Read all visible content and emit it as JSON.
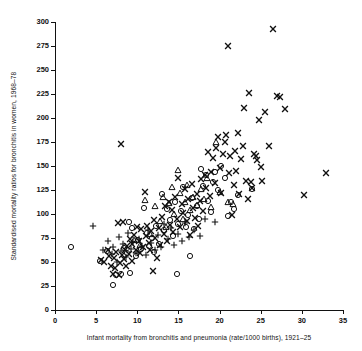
{
  "chart_data": {
    "type": "scatter",
    "title": "",
    "xlabel": "Infant mortality from bronchitis and pneumonia (rate/1000 births), 1921–25",
    "ylabel": "Standardised mortality ratios for bronchitis in women, 1968–78",
    "xlim": [
      0,
      35
    ],
    "ylim": [
      0,
      300
    ],
    "xticks": [
      0,
      5,
      10,
      15,
      20,
      25,
      30,
      35
    ],
    "yticks": [
      0,
      25,
      50,
      75,
      100,
      125,
      150,
      175,
      200,
      225,
      250,
      275,
      300
    ],
    "grid": false,
    "legend": "none",
    "marker_color": "#111111",
    "background": "#ffffff",
    "marker_types": [
      "cross",
      "circle",
      "triangle",
      "plus"
    ],
    "series": [
      {
        "name": "cross",
        "marker": "cross",
        "points": [
          [
            5.6,
            52
          ],
          [
            6.0,
            50
          ],
          [
            6.4,
            62
          ],
          [
            6.6,
            56
          ],
          [
            6.8,
            46
          ],
          [
            7.0,
            38
          ],
          [
            7.2,
            54
          ],
          [
            7.3,
            44
          ],
          [
            7.4,
            60
          ],
          [
            7.6,
            91
          ],
          [
            7.8,
            36
          ],
          [
            7.9,
            49
          ],
          [
            8.0,
            173
          ],
          [
            8.1,
            57
          ],
          [
            8.3,
            92
          ],
          [
            8.4,
            53
          ],
          [
            8.5,
            62
          ],
          [
            8.6,
            46
          ],
          [
            8.8,
            67
          ],
          [
            9.0,
            58
          ],
          [
            9.1,
            74
          ],
          [
            9.3,
            51
          ],
          [
            9.4,
            69
          ],
          [
            9.6,
            78
          ],
          [
            9.8,
            63
          ],
          [
            10.0,
            86
          ],
          [
            10.2,
            72
          ],
          [
            10.3,
            59
          ],
          [
            10.5,
            84
          ],
          [
            10.7,
            66
          ],
          [
            10.9,
            123
          ],
          [
            11.0,
            77
          ],
          [
            11.2,
            88
          ],
          [
            11.4,
            70
          ],
          [
            11.5,
            62
          ],
          [
            11.7,
            82
          ],
          [
            11.9,
            41
          ],
          [
            12.0,
            94
          ],
          [
            12.2,
            75
          ],
          [
            12.4,
            54
          ],
          [
            12.6,
            85
          ],
          [
            12.8,
            68
          ],
          [
            13.0,
            97
          ],
          [
            13.2,
            79
          ],
          [
            13.4,
            108
          ],
          [
            13.6,
            72
          ],
          [
            13.8,
            113
          ],
          [
            14.0,
            89
          ],
          [
            14.2,
            104
          ],
          [
            14.4,
            81
          ],
          [
            14.6,
            118
          ],
          [
            14.8,
            95
          ],
          [
            15.0,
            137
          ],
          [
            15.2,
            86
          ],
          [
            15.4,
            110
          ],
          [
            15.6,
            101
          ],
          [
            15.8,
            126
          ],
          [
            16.0,
            93
          ],
          [
            16.2,
            116
          ],
          [
            16.4,
            78
          ],
          [
            16.6,
            131
          ],
          [
            16.8,
            106
          ],
          [
            17.0,
            96
          ],
          [
            17.2,
            121
          ],
          [
            17.4,
            88
          ],
          [
            17.6,
            114
          ],
          [
            17.8,
            136
          ],
          [
            18.0,
            103
          ],
          [
            18.2,
            141
          ],
          [
            18.4,
            127
          ],
          [
            18.6,
            165
          ],
          [
            18.8,
            119
          ],
          [
            19.0,
            144
          ],
          [
            19.2,
            158
          ],
          [
            19.4,
            132
          ],
          [
            19.6,
            169
          ],
          [
            19.8,
            180
          ],
          [
            20.0,
            148
          ],
          [
            20.2,
            122
          ],
          [
            20.4,
            163
          ],
          [
            20.6,
            175
          ],
          [
            20.8,
            182
          ],
          [
            21.0,
            275
          ],
          [
            21.1,
            143
          ],
          [
            21.3,
            160
          ],
          [
            21.5,
            99
          ],
          [
            21.7,
            130
          ],
          [
            21.9,
            166
          ],
          [
            22.0,
            145
          ],
          [
            22.2,
            184
          ],
          [
            22.4,
            121
          ],
          [
            22.6,
            157
          ],
          [
            22.8,
            171
          ],
          [
            23.0,
            210
          ],
          [
            23.2,
            134
          ],
          [
            23.4,
            116
          ],
          [
            23.6,
            226
          ],
          [
            23.8,
            133
          ],
          [
            24.0,
            127
          ],
          [
            24.2,
            163
          ],
          [
            24.4,
            160
          ],
          [
            24.6,
            156
          ],
          [
            24.8,
            198
          ],
          [
            25.0,
            149
          ],
          [
            25.2,
            134
          ],
          [
            25.5,
            206
          ],
          [
            26.0,
            171
          ],
          [
            26.5,
            293
          ],
          [
            27.0,
            223
          ],
          [
            27.4,
            222
          ],
          [
            28.0,
            209
          ],
          [
            30.2,
            120
          ],
          [
            32.9,
            143
          ]
        ]
      },
      {
        "name": "circle",
        "marker": "circle",
        "points": [
          [
            2.0,
            66
          ],
          [
            5.5,
            51
          ],
          [
            6.3,
            61
          ],
          [
            7.0,
            26
          ],
          [
            7.4,
            36
          ],
          [
            8.0,
            37
          ],
          [
            8.4,
            65
          ],
          [
            8.8,
            59
          ],
          [
            9.0,
            92
          ],
          [
            9.1,
            39
          ],
          [
            9.4,
            85
          ],
          [
            9.8,
            56
          ],
          [
            10.1,
            73
          ],
          [
            10.4,
            64
          ],
          [
            10.8,
            106
          ],
          [
            11.2,
            80
          ],
          [
            11.4,
            67
          ],
          [
            11.8,
            75
          ],
          [
            12.0,
            60
          ],
          [
            12.3,
            88
          ],
          [
            12.6,
            69
          ],
          [
            13.0,
            121
          ],
          [
            13.3,
            83
          ],
          [
            13.6,
            105
          ],
          [
            14.0,
            94
          ],
          [
            14.3,
            77
          ],
          [
            14.6,
            112
          ],
          [
            14.8,
            37
          ],
          [
            15.0,
            90
          ],
          [
            15.3,
            103
          ],
          [
            15.6,
            128
          ],
          [
            15.9,
            86
          ],
          [
            16.2,
            99
          ],
          [
            16.4,
            56
          ],
          [
            16.6,
            117
          ],
          [
            16.9,
            84
          ],
          [
            17.2,
            108
          ],
          [
            17.5,
            95
          ],
          [
            17.8,
            147
          ],
          [
            18.0,
            129
          ],
          [
            18.3,
            141
          ],
          [
            18.6,
            114
          ],
          [
            18.9,
            102
          ],
          [
            19.2,
            133
          ],
          [
            19.5,
            144
          ],
          [
            19.8,
            125
          ],
          [
            20.2,
            150
          ],
          [
            20.6,
            137
          ],
          [
            21.0,
            98
          ],
          [
            21.4,
            112
          ],
          [
            21.8,
            105
          ],
          [
            22.2,
            120
          ],
          [
            24.0,
            126
          ]
        ]
      },
      {
        "name": "triangle",
        "marker": "triangle",
        "points": [
          [
            9.6,
            73
          ],
          [
            10.3,
            68
          ],
          [
            10.9,
            115
          ],
          [
            11.6,
            79
          ],
          [
            12.1,
            108
          ],
          [
            12.7,
            93
          ],
          [
            13.1,
            118
          ],
          [
            13.5,
            86
          ],
          [
            13.9,
            111
          ],
          [
            14.2,
            128
          ],
          [
            14.5,
            100
          ],
          [
            14.9,
            146
          ],
          [
            15.2,
            122
          ],
          [
            15.5,
            95
          ],
          [
            15.8,
            113
          ],
          [
            16.1,
            130
          ],
          [
            16.4,
            104
          ],
          [
            16.8,
            118
          ],
          [
            17.3,
            109
          ],
          [
            17.7,
            126
          ],
          [
            18.1,
            116
          ],
          [
            18.5,
            138
          ],
          [
            19.0,
            107
          ],
          [
            19.6,
            175
          ],
          [
            20.1,
            123
          ],
          [
            21.0,
            113
          ],
          [
            21.6,
            110
          ]
        ]
      },
      {
        "name": "plus",
        "marker": "plus",
        "points": [
          [
            4.6,
            87
          ],
          [
            5.8,
            63
          ],
          [
            6.4,
            72
          ],
          [
            6.9,
            58
          ],
          [
            7.1,
            66
          ],
          [
            7.5,
            50
          ],
          [
            7.8,
            76
          ],
          [
            8.0,
            61
          ],
          [
            8.3,
            69
          ],
          [
            8.6,
            55
          ],
          [
            8.9,
            80
          ],
          [
            9.2,
            64
          ],
          [
            9.5,
            71
          ],
          [
            9.9,
            59
          ],
          [
            10.2,
            74
          ],
          [
            10.6,
            67
          ],
          [
            11.0,
            57
          ],
          [
            11.3,
            83
          ],
          [
            11.7,
            70
          ],
          [
            12.1,
            62
          ],
          [
            12.5,
            78
          ],
          [
            12.9,
            66
          ],
          [
            13.3,
            90
          ],
          [
            13.7,
            74
          ],
          [
            14.1,
            85
          ],
          [
            14.5,
            68
          ],
          [
            14.9,
            79
          ],
          [
            15.4,
            72
          ],
          [
            15.8,
            91
          ],
          [
            16.3,
            76
          ],
          [
            16.9,
            83
          ],
          [
            17.6,
            77
          ],
          [
            18.2,
            95
          ],
          [
            19.4,
            92
          ]
        ]
      }
    ]
  }
}
